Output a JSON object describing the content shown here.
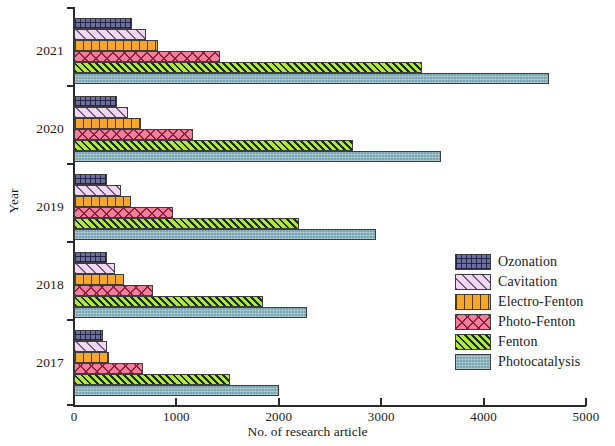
{
  "chart_data": {
    "type": "bar",
    "orientation": "horizontal",
    "title": "",
    "xlabel": "No. of research article",
    "ylabel": "Year",
    "categories": [
      "2021",
      "2020",
      "2019",
      "2018",
      "2017"
    ],
    "xlim": [
      0,
      5000
    ],
    "xticks": [
      0,
      1000,
      2000,
      3000,
      4000,
      5000
    ],
    "xtick_labels": [
      "0",
      "1000",
      "2000",
      "3000",
      "4000",
      "5000"
    ],
    "grid": false,
    "legend_position": "right",
    "series": [
      {
        "name": "Ozonation",
        "color": "#6c6f9e",
        "pattern": "crosshatch-grid",
        "values": [
          570,
          420,
          320,
          320,
          280
        ]
      },
      {
        "name": "Cavitation",
        "color": "#f3d6ef",
        "pattern": "diagonal-lines",
        "values": [
          700,
          530,
          460,
          400,
          320
        ]
      },
      {
        "name": "Electro-Fenton",
        "color": "#f6a628",
        "pattern": "vertical-lines",
        "values": [
          820,
          650,
          560,
          490,
          340
        ]
      },
      {
        "name": "Photo-Fenton",
        "color": "#f07f9c",
        "pattern": "diamond-hatch",
        "values": [
          1430,
          1160,
          970,
          770,
          670
        ]
      },
      {
        "name": "Fenton",
        "color": "#b4e63a",
        "pattern": "diagonal-hatch",
        "values": [
          3400,
          2720,
          2200,
          1850,
          1520
        ]
      },
      {
        "name": "Photocatalysis",
        "color": "#7aa7b4",
        "pattern": "speckle",
        "values": [
          4640,
          3580,
          2950,
          2280,
          2000
        ]
      }
    ]
  },
  "legend": {
    "items": [
      {
        "label": "Ozonation"
      },
      {
        "label": "Cavitation"
      },
      {
        "label": "Electro-Fenton"
      },
      {
        "label": "Photo-Fenton"
      },
      {
        "label": "Fenton"
      },
      {
        "label": "Photocatalysis"
      }
    ]
  }
}
